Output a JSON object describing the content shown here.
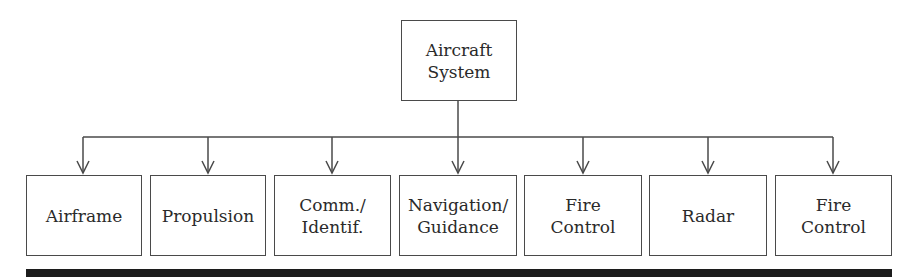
{
  "root": {
    "label": "Aircraft\nSystem"
  },
  "children": [
    {
      "label": "Airframe"
    },
    {
      "label": "Propulsion"
    },
    {
      "label": "Comm./\nIdentif."
    },
    {
      "label": "Navigation/\nGuidance"
    },
    {
      "label": "Fire\nControl"
    },
    {
      "label": "Radar"
    },
    {
      "label": "Fire\nControl"
    }
  ],
  "colors": {
    "line": "#4a4a4a",
    "bar": "#1c1c1c"
  }
}
